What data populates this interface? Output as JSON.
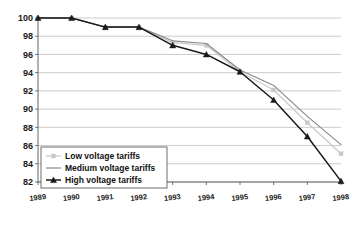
{
  "chart_data": {
    "type": "line",
    "title": "",
    "xlabel": "",
    "ylabel": "",
    "categories": [
      "1989",
      "1990",
      "1991",
      "1992",
      "1993",
      "1994",
      "1995",
      "1996",
      "1997",
      "1998"
    ],
    "ylim": [
      82,
      100
    ],
    "ytick_step": 2,
    "yticks": [
      82,
      84,
      86,
      88,
      90,
      92,
      94,
      96,
      98,
      100
    ],
    "grid": true,
    "legend_position": "bottom-left",
    "series": [
      {
        "name": "Low voltage tariffs",
        "color": "#c9c9c9",
        "marker": "square",
        "values": [
          100,
          100,
          99,
          99,
          97.3,
          97.0,
          94.1,
          92.1,
          88.5,
          85.1
        ]
      },
      {
        "name": "Medium voltage tariffs",
        "color": "#8a8a8a",
        "marker": "none",
        "values": [
          100,
          100,
          99,
          99,
          97.5,
          97.2,
          94.3,
          92.6,
          89.2,
          86.1
        ]
      },
      {
        "name": "High voltage tariffs",
        "color": "#1a1a1a",
        "marker": "triangle",
        "values": [
          100,
          100,
          99,
          99,
          97.0,
          96.0,
          94.1,
          91.0,
          87.0,
          82.1
        ]
      }
    ]
  },
  "axes": {
    "y_tick_labels": [
      "100",
      "98",
      "96",
      "94",
      "92",
      "90",
      "88",
      "86",
      "84",
      "82"
    ],
    "x_tick_labels": [
      "1989",
      "1990",
      "1991",
      "1992",
      "1993",
      "1994",
      "1995",
      "1996",
      "1997",
      "1998"
    ]
  },
  "legend": {
    "items": [
      {
        "label": "Low voltage tariffs",
        "color": "#c9c9c9",
        "marker": "square"
      },
      {
        "label": "Medium voltage tariffs",
        "color": "#8a8a8a",
        "marker": "none"
      },
      {
        "label": "High voltage tariffs",
        "color": "#1a1a1a",
        "marker": "triangle"
      }
    ]
  },
  "colors": {
    "grid": "#b4b4b4",
    "axis": "#555555",
    "background": "#ffffff",
    "low": "#c9c9c9",
    "medium": "#8a8a8a",
    "high": "#1a1a1a"
  }
}
